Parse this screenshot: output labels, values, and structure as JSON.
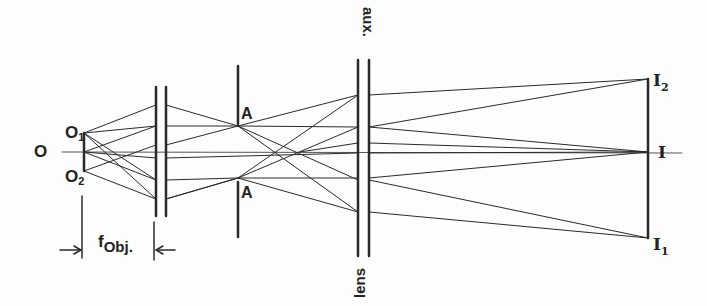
{
  "diagram": {
    "type": "optical ray diagram",
    "labels": {
      "object": "O",
      "object_point_1": {
        "base": "O",
        "sub": "1"
      },
      "object_point_2": {
        "base": "O",
        "sub": "2"
      },
      "stop_upper": "A",
      "stop_lower": "A",
      "aux_lens_label": "aux.",
      "lens_label": "lens",
      "image": "I",
      "image_point_2": {
        "base": "I",
        "sub": "2"
      },
      "image_point_1": {
        "base": "I",
        "sub": "1"
      },
      "focal_length": {
        "base": "f",
        "sub": "Obj."
      }
    },
    "colors": {
      "line": "#2a2a2a",
      "axis": "#555555",
      "background": "#fdfdfd"
    }
  }
}
